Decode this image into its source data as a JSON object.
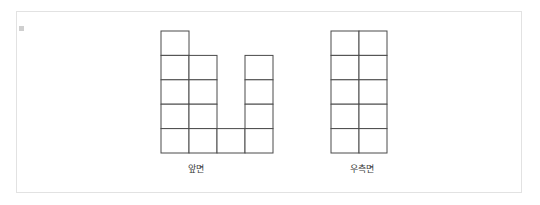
{
  "panel": {
    "border_color": "#e2e2e2",
    "background": "#ffffff"
  },
  "style": {
    "stroke_color": "#4a4a4a",
    "cell_width": 28,
    "cell_height": 24.4,
    "label_color": "#3b3b3b"
  },
  "figures": [
    {
      "id": "front-view",
      "label": "앞면",
      "columns": 4,
      "rows": 5,
      "column_heights": [
        5,
        4,
        1,
        4
      ],
      "filled_cells": [
        [
          1,
          0,
          0,
          0
        ],
        [
          1,
          1,
          0,
          1
        ],
        [
          1,
          1,
          0,
          1
        ],
        [
          1,
          1,
          0,
          1
        ],
        [
          1,
          1,
          1,
          1
        ]
      ]
    },
    {
      "id": "side-view",
      "label": "우측면",
      "columns": 2,
      "rows": 5,
      "column_heights": [
        5,
        5
      ],
      "filled_cells": [
        [
          1,
          1
        ],
        [
          1,
          1
        ],
        [
          1,
          1
        ],
        [
          1,
          1
        ],
        [
          1,
          1
        ]
      ]
    }
  ]
}
